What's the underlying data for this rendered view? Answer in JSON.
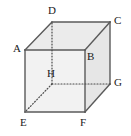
{
  "figure": {
    "name": "cube-diagram",
    "width": 131,
    "height": 136,
    "background_color": "#ffffff",
    "style": {
      "edge_color": "#5a5a5a",
      "hidden_edge_color": "#4a4a4a",
      "front_face_color": "#f2f2f2",
      "top_face_color": "#ebebeb",
      "right_face_color": "#e6e6e6",
      "label_color": "#1a1a1a",
      "edge_width": 1.4,
      "hidden_edge_width": 1.2,
      "hidden_edge_dash": "1,2"
    },
    "vertices": [
      {
        "id": "A",
        "label": "A",
        "x": 25,
        "y": 50,
        "label_x": 13,
        "label_y": 43,
        "hidden": false
      },
      {
        "id": "B",
        "label": "B",
        "x": 85,
        "y": 50,
        "label_x": 87,
        "label_y": 51,
        "hidden": false
      },
      {
        "id": "C",
        "label": "C",
        "x": 110,
        "y": 22,
        "label_x": 114,
        "label_y": 15,
        "hidden": false
      },
      {
        "id": "D",
        "label": "D",
        "x": 52,
        "y": 22,
        "label_x": 48,
        "label_y": 5,
        "hidden": false
      },
      {
        "id": "E",
        "label": "E",
        "x": 25,
        "y": 112,
        "label_x": 20,
        "label_y": 117,
        "hidden": false
      },
      {
        "id": "F",
        "label": "F",
        "x": 85,
        "y": 112,
        "label_x": 80,
        "label_y": 117,
        "hidden": false
      },
      {
        "id": "G",
        "label": "G",
        "x": 110,
        "y": 84,
        "label_x": 114,
        "label_y": 77,
        "hidden": false
      },
      {
        "id": "H",
        "label": "H",
        "x": 52,
        "y": 84,
        "label_x": 47,
        "label_y": 68,
        "hidden": true
      }
    ],
    "faces": [
      {
        "id": "top",
        "name": "top-face",
        "points": "25,50 52,22 110,22 85,50",
        "fill": "#ebebeb"
      },
      {
        "id": "right",
        "name": "right-face",
        "points": "85,50 110,22 110,84 85,112",
        "fill": "#e6e6e6"
      },
      {
        "id": "front",
        "name": "front-face",
        "points": "25,50 85,50 85,112 25,112",
        "fill": "#f2f2f2"
      }
    ],
    "edges": [
      {
        "id": "AB",
        "from": "A",
        "to": "B",
        "hidden": false
      },
      {
        "id": "BF",
        "from": "B",
        "to": "F",
        "hidden": false
      },
      {
        "id": "FE",
        "from": "F",
        "to": "E",
        "hidden": false
      },
      {
        "id": "EA",
        "from": "E",
        "to": "A",
        "hidden": false
      },
      {
        "id": "DC",
        "from": "D",
        "to": "C",
        "hidden": false
      },
      {
        "id": "CG",
        "from": "C",
        "to": "G",
        "hidden": false
      },
      {
        "id": "AD",
        "from": "A",
        "to": "D",
        "hidden": false
      },
      {
        "id": "BC",
        "from": "B",
        "to": "C",
        "hidden": false
      },
      {
        "id": "FG",
        "from": "F",
        "to": "G",
        "hidden": false
      },
      {
        "id": "HD",
        "from": "H",
        "to": "D",
        "hidden": true
      },
      {
        "id": "HG",
        "from": "H",
        "to": "G",
        "hidden": true
      },
      {
        "id": "HE",
        "from": "H",
        "to": "E",
        "hidden": true
      }
    ]
  }
}
